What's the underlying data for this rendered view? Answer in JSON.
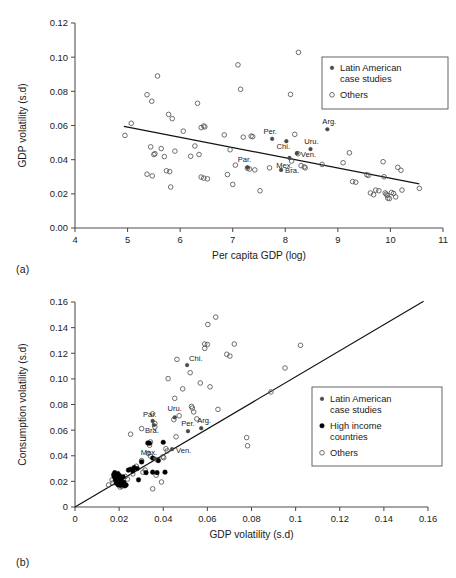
{
  "figure": {
    "panel_a_tag": "(a)",
    "panel_b_tag": "(b)"
  },
  "chart_data": [
    {
      "id": "panel_a",
      "type": "scatter",
      "title": "",
      "xlabel": "Per capita GDP (log)",
      "ylabel": "GDP volatility (s.d)",
      "xlim": [
        4,
        11
      ],
      "ylim": [
        0.0,
        0.12
      ],
      "xticks": [
        "4",
        "5",
        "6",
        "7",
        "8",
        "9",
        "10",
        "11"
      ],
      "yticks": [
        "0.00",
        "0.02",
        "0.04",
        "0.06",
        "0.08",
        "0.10",
        "0.12"
      ],
      "grid": false,
      "legend_position": "top-right",
      "legend": [
        {
          "label": "Latin American case studies",
          "marker": "small-filled"
        },
        {
          "label": "Others",
          "marker": "open-circle"
        }
      ],
      "trendline": {
        "x": [
          4.93,
          10.55
        ],
        "y": [
          0.0595,
          0.0258
        ]
      },
      "series": [
        {
          "name": "Latin American case studies",
          "marker": "small-filled",
          "points": [
            {
              "label": "Per.",
              "x": 7.75,
              "y": 0.0522
            },
            {
              "label": "Chi.",
              "x": 8.02,
              "y": 0.0508
            },
            {
              "label": "Ven.",
              "x": 8.22,
              "y": 0.0438
            },
            {
              "label": "Uru.",
              "x": 8.48,
              "y": 0.0462
            },
            {
              "label": "Arg.",
              "x": 8.8,
              "y": 0.0578
            },
            {
              "label": "Par.",
              "x": 7.28,
              "y": 0.0355
            },
            {
              "label": "Bra.",
              "x": 7.92,
              "y": 0.034
            },
            {
              "label": "Mex.",
              "x": 8.08,
              "y": 0.041
            }
          ]
        },
        {
          "name": "Others",
          "marker": "open-circle",
          "points": [
            {
              "x": 4.95,
              "y": 0.0542
            },
            {
              "x": 5.07,
              "y": 0.0613
            },
            {
              "x": 5.37,
              "y": 0.078
            },
            {
              "x": 5.46,
              "y": 0.0742
            },
            {
              "x": 5.57,
              "y": 0.089
            },
            {
              "x": 5.78,
              "y": 0.0665
            },
            {
              "x": 5.85,
              "y": 0.064
            },
            {
              "x": 6.06,
              "y": 0.0567
            },
            {
              "x": 6.33,
              "y": 0.073
            },
            {
              "x": 6.4,
              "y": 0.0588
            },
            {
              "x": 6.45,
              "y": 0.0597
            },
            {
              "x": 6.47,
              "y": 0.0592
            },
            {
              "x": 6.84,
              "y": 0.0545
            },
            {
              "x": 7.1,
              "y": 0.0955
            },
            {
              "x": 7.15,
              "y": 0.0812
            },
            {
              "x": 7.2,
              "y": 0.0532
            },
            {
              "x": 7.35,
              "y": 0.0538
            },
            {
              "x": 7.38,
              "y": 0.0535
            },
            {
              "x": 5.44,
              "y": 0.0475
            },
            {
              "x": 5.52,
              "y": 0.0435
            },
            {
              "x": 5.5,
              "y": 0.043
            },
            {
              "x": 5.64,
              "y": 0.0465
            },
            {
              "x": 5.7,
              "y": 0.0418
            },
            {
              "x": 5.9,
              "y": 0.045
            },
            {
              "x": 6.2,
              "y": 0.042
            },
            {
              "x": 6.28,
              "y": 0.048
            },
            {
              "x": 6.36,
              "y": 0.043
            },
            {
              "x": 6.95,
              "y": 0.0458
            },
            {
              "x": 7.05,
              "y": 0.0368
            },
            {
              "x": 7.42,
              "y": 0.034
            },
            {
              "x": 5.37,
              "y": 0.0315
            },
            {
              "x": 5.47,
              "y": 0.0305
            },
            {
              "x": 5.74,
              "y": 0.0335
            },
            {
              "x": 5.8,
              "y": 0.033
            },
            {
              "x": 5.82,
              "y": 0.024
            },
            {
              "x": 6.4,
              "y": 0.0298
            },
            {
              "x": 6.45,
              "y": 0.0292
            },
            {
              "x": 6.52,
              "y": 0.0288
            },
            {
              "x": 6.9,
              "y": 0.0313
            },
            {
              "x": 7.0,
              "y": 0.0255
            },
            {
              "x": 7.28,
              "y": 0.035
            },
            {
              "x": 7.32,
              "y": 0.0345
            },
            {
              "x": 7.52,
              "y": 0.0218
            },
            {
              "x": 7.7,
              "y": 0.0352
            },
            {
              "x": 8.12,
              "y": 0.0392
            },
            {
              "x": 8.18,
              "y": 0.0548
            },
            {
              "x": 8.24,
              "y": 0.0435
            },
            {
              "x": 8.25,
              "y": 0.1028
            },
            {
              "x": 8.1,
              "y": 0.0782
            },
            {
              "x": 8.3,
              "y": 0.0365
            },
            {
              "x": 8.36,
              "y": 0.0358
            },
            {
              "x": 8.38,
              "y": 0.0352
            },
            {
              "x": 8.7,
              "y": 0.0372
            },
            {
              "x": 9.1,
              "y": 0.0382
            },
            {
              "x": 9.22,
              "y": 0.044
            },
            {
              "x": 9.28,
              "y": 0.0272
            },
            {
              "x": 9.34,
              "y": 0.0268
            },
            {
              "x": 9.55,
              "y": 0.0312
            },
            {
              "x": 9.58,
              "y": 0.0308
            },
            {
              "x": 9.62,
              "y": 0.0205
            },
            {
              "x": 9.68,
              "y": 0.0195
            },
            {
              "x": 9.72,
              "y": 0.0222
            },
            {
              "x": 9.78,
              "y": 0.0218
            },
            {
              "x": 9.86,
              "y": 0.0388
            },
            {
              "x": 9.88,
              "y": 0.03
            },
            {
              "x": 9.9,
              "y": 0.0205
            },
            {
              "x": 9.92,
              "y": 0.0198
            },
            {
              "x": 9.94,
              "y": 0.0192
            },
            {
              "x": 9.95,
              "y": 0.0175
            },
            {
              "x": 9.98,
              "y": 0.0172
            },
            {
              "x": 10.02,
              "y": 0.0208
            },
            {
              "x": 10.06,
              "y": 0.0202
            },
            {
              "x": 10.1,
              "y": 0.0182
            },
            {
              "x": 10.14,
              "y": 0.0355
            },
            {
              "x": 10.2,
              "y": 0.0338
            },
            {
              "x": 10.22,
              "y": 0.0222
            },
            {
              "x": 10.55,
              "y": 0.0232
            }
          ]
        }
      ]
    },
    {
      "id": "panel_b",
      "type": "scatter",
      "title": "",
      "xlabel": "GDP volatility (s.d)",
      "ylabel": "Consumption volatility (s.d)",
      "xlim": [
        0,
        0.16
      ],
      "ylim": [
        0,
        0.16
      ],
      "xticks": [
        "0",
        "0.02",
        "0.04",
        "0.06",
        "0.08",
        "0.1",
        "0.12",
        "0.14",
        "0.16"
      ],
      "yticks": [
        "0",
        "0.02",
        "0.04",
        "0.06",
        "0.08",
        "0.10",
        "0.12",
        "0.14",
        "0.16"
      ],
      "grid": false,
      "legend_position": "right",
      "legend": [
        {
          "label": "Latin American case studies",
          "marker": "small-filled"
        },
        {
          "label": "High income countries",
          "marker": "filled-circle"
        },
        {
          "label": "Others",
          "marker": "open-circle"
        }
      ],
      "trendline": {
        "x": [
          0.0,
          0.158
        ],
        "y": [
          0.0,
          0.1605
        ]
      },
      "series": [
        {
          "name": "Latin American case studies",
          "marker": "small-filled",
          "points": [
            {
              "label": "Chi.",
              "x": 0.0508,
              "y": 0.1108
            },
            {
              "label": "Par.",
              "x": 0.0352,
              "y": 0.0672
            },
            {
              "label": "Uru.",
              "x": 0.0452,
              "y": 0.07
            },
            {
              "label": "Per.",
              "x": 0.0512,
              "y": 0.0592
            },
            {
              "label": "Arg.",
              "x": 0.0572,
              "y": 0.0615
            },
            {
              "label": "Bra.",
              "x": 0.0358,
              "y": 0.064
            },
            {
              "label": "Mex.",
              "x": 0.0362,
              "y": 0.0378
            },
            {
              "label": "Ven.",
              "x": 0.044,
              "y": 0.0452
            }
          ]
        },
        {
          "name": "High income countries",
          "marker": "filled-circle",
          "points": [
            {
              "x": 0.0175,
              "y": 0.0252
            },
            {
              "x": 0.0178,
              "y": 0.0238
            },
            {
              "x": 0.018,
              "y": 0.0268
            },
            {
              "x": 0.0182,
              "y": 0.0222
            },
            {
              "x": 0.0185,
              "y": 0.0205
            },
            {
              "x": 0.0186,
              "y": 0.0248
            },
            {
              "x": 0.0188,
              "y": 0.0185
            },
            {
              "x": 0.019,
              "y": 0.0232
            },
            {
              "x": 0.0192,
              "y": 0.0215
            },
            {
              "x": 0.0194,
              "y": 0.0262
            },
            {
              "x": 0.0196,
              "y": 0.0172
            },
            {
              "x": 0.0198,
              "y": 0.0198
            },
            {
              "x": 0.02,
              "y": 0.0225
            },
            {
              "x": 0.0202,
              "y": 0.0245
            },
            {
              "x": 0.0204,
              "y": 0.0188
            },
            {
              "x": 0.0208,
              "y": 0.0168
            },
            {
              "x": 0.021,
              "y": 0.0212
            },
            {
              "x": 0.0214,
              "y": 0.0178
            },
            {
              "x": 0.0218,
              "y": 0.0235
            },
            {
              "x": 0.0222,
              "y": 0.0192
            },
            {
              "x": 0.0226,
              "y": 0.0165
            },
            {
              "x": 0.0232,
              "y": 0.0172
            },
            {
              "x": 0.0242,
              "y": 0.0288
            },
            {
              "x": 0.0252,
              "y": 0.0295
            },
            {
              "x": 0.0262,
              "y": 0.0282
            },
            {
              "x": 0.0268,
              "y": 0.0308
            },
            {
              "x": 0.0282,
              "y": 0.03
            },
            {
              "x": 0.0288,
              "y": 0.0212
            },
            {
              "x": 0.0302,
              "y": 0.0352
            },
            {
              "x": 0.0322,
              "y": 0.0268
            },
            {
              "x": 0.033,
              "y": 0.05
            },
            {
              "x": 0.0338,
              "y": 0.0498
            },
            {
              "x": 0.0352,
              "y": 0.0272
            },
            {
              "x": 0.0372,
              "y": 0.0268
            },
            {
              "x": 0.0378,
              "y": 0.0362
            },
            {
              "x": 0.04,
              "y": 0.0505
            },
            {
              "x": 0.0408,
              "y": 0.0272
            },
            {
              "x": 0.0352,
              "y": 0.0382
            }
          ]
        },
        {
          "name": "Others",
          "marker": "open-circle",
          "points": [
            {
              "x": 0.0638,
              "y": 0.1482
            },
            {
              "x": 0.0602,
              "y": 0.1425
            },
            {
              "x": 0.0588,
              "y": 0.1272
            },
            {
              "x": 0.06,
              "y": 0.1268
            },
            {
              "x": 0.0588,
              "y": 0.1238
            },
            {
              "x": 0.0722,
              "y": 0.1272
            },
            {
              "x": 0.1022,
              "y": 0.1262
            },
            {
              "x": 0.0688,
              "y": 0.1192
            },
            {
              "x": 0.0702,
              "y": 0.1178
            },
            {
              "x": 0.0462,
              "y": 0.1152
            },
            {
              "x": 0.0522,
              "y": 0.1048
            },
            {
              "x": 0.0952,
              "y": 0.1085
            },
            {
              "x": 0.0422,
              "y": 0.1002
            },
            {
              "x": 0.0568,
              "y": 0.0968
            },
            {
              "x": 0.0488,
              "y": 0.0922
            },
            {
              "x": 0.0612,
              "y": 0.0938
            },
            {
              "x": 0.0888,
              "y": 0.0898
            },
            {
              "x": 0.0452,
              "y": 0.0848
            },
            {
              "x": 0.0528,
              "y": 0.0785
            },
            {
              "x": 0.0532,
              "y": 0.0772
            },
            {
              "x": 0.0648,
              "y": 0.0762
            },
            {
              "x": 0.0538,
              "y": 0.0742
            },
            {
              "x": 0.0352,
              "y": 0.0728
            },
            {
              "x": 0.0472,
              "y": 0.0712
            },
            {
              "x": 0.0552,
              "y": 0.0688
            },
            {
              "x": 0.0448,
              "y": 0.0682
            },
            {
              "x": 0.0362,
              "y": 0.0652
            },
            {
              "x": 0.0302,
              "y": 0.0612
            },
            {
              "x": 0.0362,
              "y": 0.0625
            },
            {
              "x": 0.0252,
              "y": 0.0568
            },
            {
              "x": 0.0458,
              "y": 0.0548
            },
            {
              "x": 0.0778,
              "y": 0.0542
            },
            {
              "x": 0.0782,
              "y": 0.0478
            },
            {
              "x": 0.0342,
              "y": 0.0508
            },
            {
              "x": 0.0338,
              "y": 0.0482
            },
            {
              "x": 0.0412,
              "y": 0.0455
            },
            {
              "x": 0.0418,
              "y": 0.0438
            },
            {
              "x": 0.0332,
              "y": 0.0418
            },
            {
              "x": 0.0398,
              "y": 0.0392
            },
            {
              "x": 0.0402,
              "y": 0.0385
            },
            {
              "x": 0.0372,
              "y": 0.0368
            },
            {
              "x": 0.0302,
              "y": 0.0362
            },
            {
              "x": 0.0278,
              "y": 0.0318
            },
            {
              "x": 0.0318,
              "y": 0.0288
            },
            {
              "x": 0.0308,
              "y": 0.0272
            },
            {
              "x": 0.0262,
              "y": 0.0258
            },
            {
              "x": 0.0238,
              "y": 0.0218
            },
            {
              "x": 0.0368,
              "y": 0.0248
            },
            {
              "x": 0.0392,
              "y": 0.0195
            },
            {
              "x": 0.0352,
              "y": 0.0142
            },
            {
              "x": 0.0172,
              "y": 0.0188
            },
            {
              "x": 0.0168,
              "y": 0.0212
            },
            {
              "x": 0.0212,
              "y": 0.0162
            },
            {
              "x": 0.0228,
              "y": 0.0238
            },
            {
              "x": 0.0205,
              "y": 0.0155
            },
            {
              "x": 0.0152,
              "y": 0.0172
            },
            {
              "x": 0.0342,
              "y": 0.0398
            }
          ]
        }
      ]
    }
  ]
}
